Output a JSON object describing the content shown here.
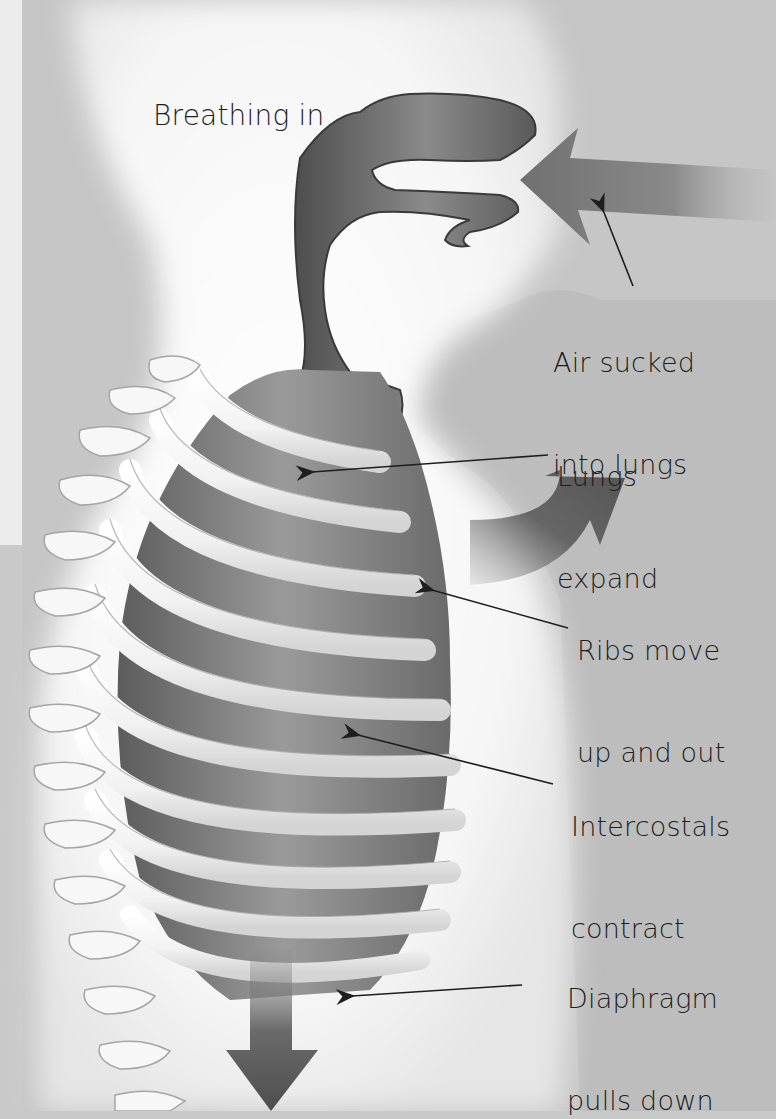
{
  "diagram": {
    "title": "Breathing in",
    "colors": {
      "background": "#c9c9c9",
      "body_glow": "#ffffff",
      "airway": "#5a5a5a",
      "lung": "#7d7d7d",
      "bone": "#f4f4f4",
      "arrow": "#6a6a6a",
      "text": "#1e1e1e"
    },
    "labels": [
      {
        "id": "air",
        "lines": [
          "Air sucked",
          "into lungs"
        ]
      },
      {
        "id": "lungs",
        "lines": [
          "Lungs",
          "expand"
        ]
      },
      {
        "id": "ribs",
        "lines": [
          "Ribs move",
          "up and out"
        ]
      },
      {
        "id": "intercostals",
        "lines": [
          "Intercostals",
          "contract"
        ]
      },
      {
        "id": "diaphragm",
        "lines": [
          "Diaphragm",
          "pulls down"
        ]
      }
    ],
    "arrows": [
      {
        "id": "air-in-arrow",
        "direction": "left",
        "meaning": "air entering nose"
      },
      {
        "id": "ribs-out-arrow",
        "direction": "up-right",
        "meaning": "ribs move up and out"
      },
      {
        "id": "diaphragm-down-arrow",
        "direction": "down",
        "meaning": "diaphragm pulls down"
      }
    ]
  }
}
